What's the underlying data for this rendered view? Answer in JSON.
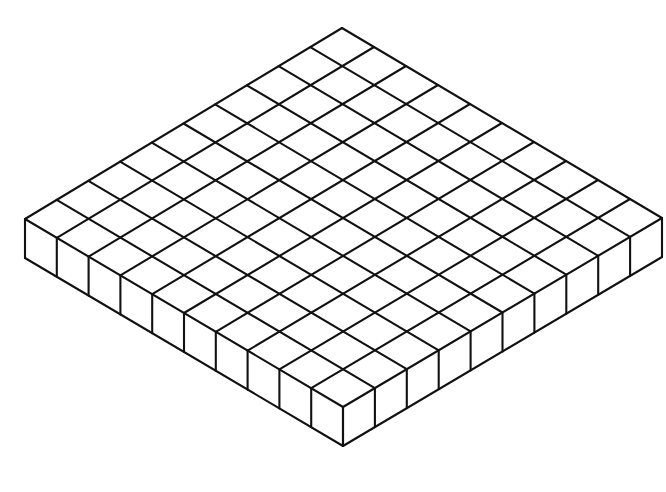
{
  "diagram": {
    "grid": {
      "rows": 10,
      "columns": 10,
      "layers": 1
    },
    "total_cubes": 100,
    "colors": {
      "background": "#ffffff",
      "line": "#111111",
      "face": "#ffffff"
    }
  }
}
